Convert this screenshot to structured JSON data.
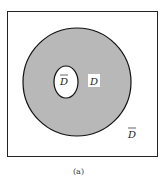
{
  "diagram": {
    "caption": "(a)",
    "regions": {
      "inner_hole_label": "D",
      "ring_label": "D",
      "outer_label": "D"
    },
    "colors": {
      "ring_fill": "#b8b8b8",
      "border": "#111111",
      "background": "#ffffff"
    }
  }
}
